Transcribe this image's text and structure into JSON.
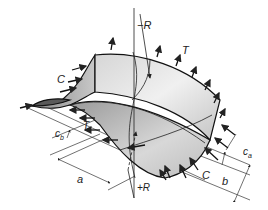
{
  "diagram": {
    "labels": {
      "minus_r": "−R",
      "plus_r": "+R",
      "t_top": "T",
      "t_mid": "T",
      "c_left": "C",
      "c_right": "C",
      "a": "a",
      "b": "b",
      "ca": "c",
      "ca_sub": "a",
      "cb": "c",
      "cb_sub": "b"
    },
    "colors": {
      "stroke": "#222222",
      "surface_light": "#ececec",
      "surface_mid": "#b8b8b8",
      "surface_dark": "#6e6e6e",
      "background": "#ffffff"
    }
  }
}
